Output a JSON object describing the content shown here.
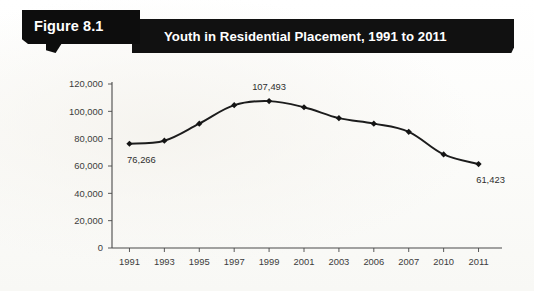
{
  "figure": {
    "label": "Figure 8.1",
    "title": "Youth in Residential Placement, 1991 to 2011"
  },
  "chart_data": {
    "type": "line",
    "title": "Youth in Residential Placement, 1991 to 2011",
    "xlabel": "",
    "ylabel": "",
    "categories": [
      "1991",
      "1993",
      "1995",
      "1997",
      "1999",
      "2001",
      "2003",
      "2006",
      "2007",
      "2010",
      "2011"
    ],
    "values": [
      76266,
      78500,
      91000,
      104500,
      107493,
      103000,
      95000,
      91000,
      85000,
      68500,
      61423
    ],
    "ylim": [
      0,
      120000
    ],
    "yticks": [
      0,
      20000,
      40000,
      60000,
      80000,
      100000,
      120000
    ],
    "ytick_labels": [
      "0",
      "20,000",
      "40,000",
      "60,000",
      "80,000",
      "100,000",
      "120,000"
    ],
    "grid": false,
    "legend": "none",
    "marker": "diamond",
    "line_color": "#1c1c1c",
    "annotations": [
      {
        "category": "1991",
        "value": 76266,
        "text": "76,266",
        "position": "below"
      },
      {
        "category": "1999",
        "value": 107493,
        "text": "107,493",
        "position": "above"
      },
      {
        "category": "2011",
        "value": 61423,
        "text": "61,423",
        "position": "below"
      }
    ]
  },
  "colors": {
    "banner_background": "#111111",
    "banner_text": "#ffffff",
    "page_background": "#fdfdfb",
    "axis": "#4a4a4a",
    "series": "#1c1c1c"
  }
}
